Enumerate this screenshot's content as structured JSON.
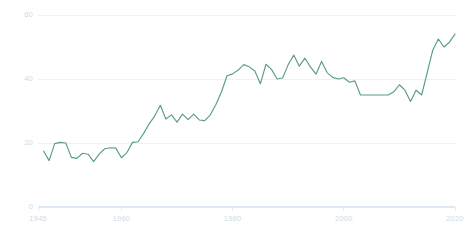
{
  "chart_data": {
    "type": "line",
    "title": "",
    "subtitle": "",
    "xlabel": "",
    "ylabel": "",
    "xlim": [
      1945,
      2020
    ],
    "ylim": [
      0,
      60
    ],
    "grid": true,
    "legend": null,
    "legend_position": "none",
    "colors": {
      "line": "#5a9b8e",
      "grid": "#eef2f6",
      "axis": "#dfe9f3",
      "tick_text": "#cfdbe6",
      "background": "#ffffff"
    },
    "y_ticks": [
      0,
      20,
      40,
      60
    ],
    "y_tick_labels": [
      "0",
      "20",
      "40",
      "60"
    ],
    "x_ticks": [
      1945,
      1960,
      1980,
      2000,
      2020
    ],
    "x_tick_labels": [
      "1945",
      "1960",
      "1980",
      "2000",
      "2020"
    ],
    "series": [
      {
        "name": "series-1",
        "x": [
          1946,
          1947,
          1948,
          1949,
          1950,
          1951,
          1952,
          1953,
          1954,
          1955,
          1956,
          1957,
          1958,
          1959,
          1960,
          1961,
          1962,
          1963,
          1964,
          1965,
          1966,
          1967,
          1968,
          1969,
          1970,
          1971,
          1972,
          1973,
          1974,
          1975,
          1976,
          1977,
          1978,
          1979,
          1980,
          1981,
          1982,
          1983,
          1984,
          1985,
          1986,
          1987,
          1988,
          1989,
          1990,
          1991,
          1992,
          1993,
          1994,
          1995,
          1996,
          1997,
          1998,
          1999,
          2000,
          2001,
          2002,
          2003,
          2004,
          2005,
          2006,
          2007,
          2008,
          2009,
          2010,
          2011,
          2012,
          2013,
          2014,
          2015,
          2016,
          2017,
          2018,
          2019,
          2020
        ],
        "y": [
          17.5,
          14.5,
          19.8,
          20.2,
          20.0,
          15.5,
          15.2,
          16.8,
          16.5,
          14.2,
          16.5,
          18.2,
          18.5,
          18.4,
          15.4,
          17.0,
          20.2,
          20.4,
          23.0,
          26.0,
          28.5,
          31.8,
          27.5,
          28.8,
          26.5,
          29.0,
          27.3,
          29.0,
          27.2,
          27.0,
          28.8,
          32.0,
          36.0,
          41.0,
          41.6,
          42.8,
          44.5,
          43.8,
          42.5,
          38.5,
          44.6,
          43.0,
          40.0,
          40.3,
          44.5,
          47.5,
          44.0,
          46.5,
          43.8,
          41.5,
          45.5,
          42.0,
          40.5,
          40.0,
          40.4,
          39.0,
          39.4,
          35.0,
          35.0,
          35.0,
          35.0,
          35.0,
          35.0,
          36.0,
          38.2,
          36.5,
          33.0,
          36.5,
          35.0,
          42.0,
          49.0,
          52.5,
          50.0,
          51.5,
          54.0
        ]
      }
    ]
  }
}
